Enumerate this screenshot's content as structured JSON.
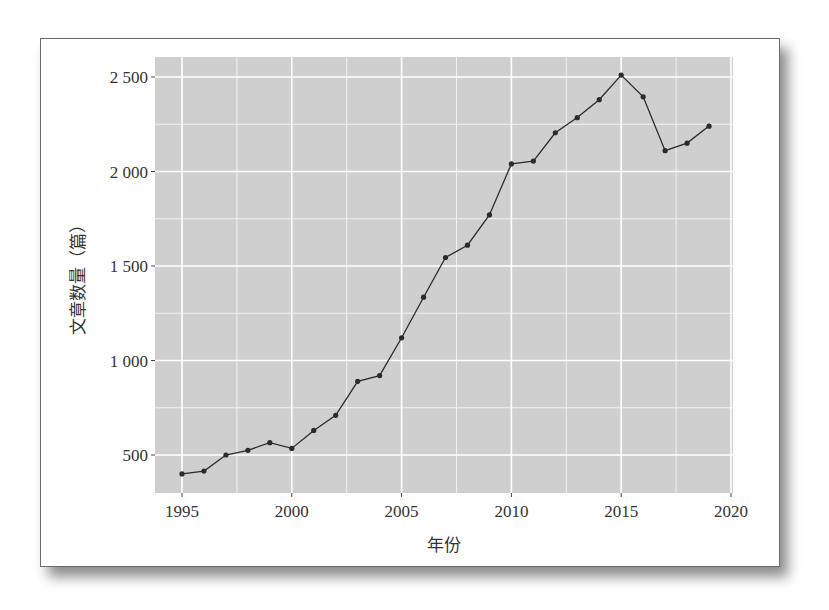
{
  "chart_data": {
    "type": "line",
    "title": "",
    "xlabel": "年份",
    "ylabel": "文章数量（篇）",
    "x": [
      1995,
      1996,
      1997,
      1998,
      1999,
      2000,
      2001,
      2002,
      2003,
      2004,
      2005,
      2006,
      2007,
      2008,
      2009,
      2010,
      2011,
      2012,
      2013,
      2014,
      2015,
      2016,
      2017,
      2018,
      2019
    ],
    "values": [
      400,
      415,
      500,
      525,
      565,
      535,
      630,
      710,
      890,
      920,
      1120,
      1335,
      1545,
      1610,
      1770,
      2040,
      2055,
      2205,
      2285,
      2380,
      2510,
      2395,
      2110,
      2150,
      2240
    ],
    "xlim": [
      1993.7,
      2020.1
    ],
    "ylim": [
      300,
      2600
    ],
    "x_ticks": [
      1995,
      2000,
      2005,
      2010,
      2015,
      2020
    ],
    "x_tick_labels": [
      "1995",
      "2000",
      "2005",
      "2010",
      "2015",
      "2020"
    ],
    "y_ticks": [
      500,
      1000,
      1500,
      2000,
      2500
    ],
    "y_tick_labels": [
      "500",
      "1 000",
      "1 500",
      "2 000",
      "2 500"
    ],
    "grid": true,
    "legend": "none",
    "markers": true,
    "colors": {
      "panel_background": "#cfcfcf",
      "grid_major": "#ffffff",
      "grid_minor": "#f2f2f2",
      "line": "#2b2b2b",
      "text": "#333333"
    }
  }
}
